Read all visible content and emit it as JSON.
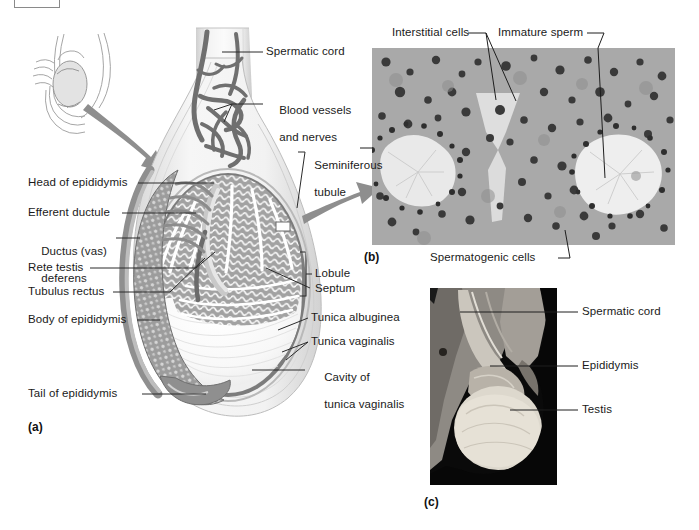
{
  "figure": {
    "panels": [
      {
        "tag": "(a)",
        "name": "sagittal-section-of-testis"
      },
      {
        "tag": "(b)",
        "name": "light-micrograph-of-seminiferous-tubules"
      },
      {
        "tag": "(c)",
        "name": "cadaver-photograph-of-testis"
      }
    ]
  },
  "panel_a": {
    "tag": "(a)",
    "labels_right": [
      {
        "id": "spermatic-cord",
        "text": "Spermatic cord"
      },
      {
        "id": "blood-vessels-and-nerves",
        "line1": "Blood vessels",
        "line2": "and nerves"
      },
      {
        "id": "seminiferous-tubule",
        "line1": "Seminiferous",
        "line2": "tubule"
      },
      {
        "id": "lobule",
        "text": "Lobule"
      },
      {
        "id": "septum",
        "text": "Septum"
      },
      {
        "id": "tunica-albuginea",
        "text": "Tunica albuginea"
      },
      {
        "id": "tunica-vaginalis",
        "text": "Tunica vaginalis"
      },
      {
        "id": "cavity-of-tunica-vaginalis",
        "line1": "Cavity of",
        "line2": "tunica vaginalis"
      }
    ],
    "labels_left": [
      {
        "id": "head-of-epididymis",
        "text": "Head of epididymis"
      },
      {
        "id": "efferent-ductule",
        "text": "Efferent ductule"
      },
      {
        "id": "ductus-vas-deferens",
        "line1": "Ductus (vas)",
        "line2": "deferens"
      },
      {
        "id": "rete-testis",
        "text": "Rete testis"
      },
      {
        "id": "tubulus-rectus",
        "text": "Tubulus rectus"
      },
      {
        "id": "body-of-epididymis",
        "text": "Body of epididymis"
      },
      {
        "id": "tail-of-epididymis",
        "text": "Tail of epididymis"
      }
    ]
  },
  "panel_b": {
    "tag": "(b)",
    "labels": [
      {
        "id": "interstitial-cells",
        "text": "Interstitial cells"
      },
      {
        "id": "immature-sperm",
        "text": "Immature sperm"
      },
      {
        "id": "spermatogenic-cells",
        "text": "Spermatogenic cells"
      }
    ]
  },
  "panel_c": {
    "tag": "(c)",
    "labels": [
      {
        "id": "spermatic-cord",
        "text": "Spermatic cord"
      },
      {
        "id": "epididymis",
        "text": "Epididymis"
      },
      {
        "id": "testis",
        "text": "Testis"
      }
    ]
  },
  "colors": {
    "text": "#1a1a1a",
    "leader_line": "#2b2b2b",
    "tissue_mid_gray": "#9a9a9a",
    "tissue_dark_gray": "#6e6e6e",
    "vessel_gray": "#707070",
    "tunica_gray": "#767676",
    "arrow_gray": "#8e8e8e",
    "background": "#ffffff"
  }
}
